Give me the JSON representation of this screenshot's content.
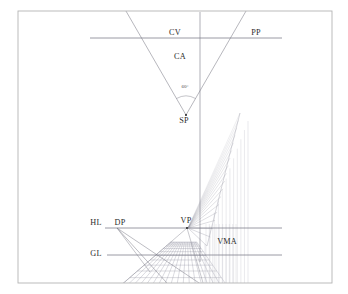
{
  "figure": {
    "background_color": "#ffffff",
    "border_color": "#b4b4b4",
    "line_color": "#7a7a86",
    "grid_color": "#9a9aa6",
    "grid_color_light": "#b9b9c4",
    "label_color": "#2b2b2b"
  },
  "border": {
    "x": 18,
    "y": 11,
    "width": 314,
    "height": 272
  },
  "labels": [
    {
      "id": "CV",
      "text": "CV",
      "x": 175,
      "y": 35,
      "anchor": "middle",
      "name": "label-cv"
    },
    {
      "id": "PP",
      "text": "PP",
      "x": 256,
      "y": 35,
      "anchor": "middle",
      "name": "label-pp"
    },
    {
      "id": "CA",
      "text": "CA",
      "x": 180,
      "y": 59,
      "anchor": "middle",
      "name": "label-ca"
    },
    {
      "id": "SP",
      "text": "SP",
      "x": 184,
      "y": 123,
      "anchor": "middle",
      "name": "label-sp"
    },
    {
      "id": "HL",
      "text": "HL",
      "x": 96,
      "y": 225,
      "anchor": "middle",
      "name": "label-hl"
    },
    {
      "id": "DP",
      "text": "DP",
      "x": 120,
      "y": 225,
      "anchor": "middle",
      "name": "label-dp"
    },
    {
      "id": "VP",
      "text": "VP",
      "x": 186,
      "y": 223,
      "anchor": "middle",
      "name": "label-vp"
    },
    {
      "id": "GL",
      "text": "GL",
      "x": 96,
      "y": 256,
      "anchor": "middle",
      "name": "label-gl"
    },
    {
      "id": "VMA",
      "text": "VMA",
      "x": 227,
      "y": 244,
      "anchor": "middle",
      "name": "label-vma"
    }
  ],
  "angle_annotation": {
    "text": "60°",
    "x": 185,
    "y": 88,
    "arc_radius": 19,
    "name": "cone-angle-label"
  },
  "geometry": {
    "station_point": {
      "x": 186,
      "y": 115
    },
    "cone_angle_deg": 60,
    "center_of_vision": {
      "x": 200,
      "y": 38
    },
    "vanishing_point": {
      "x": 187,
      "y": 228
    },
    "distance_point": {
      "x": 117,
      "y": 228
    },
    "vertical_axis_x": 200,
    "picture_plane_line": {
      "x1": 90,
      "x2": 282,
      "y": 38
    },
    "horizon_line": {
      "x1": 105,
      "x2": 282,
      "y": 228
    },
    "ground_line": {
      "x1": 107,
      "x2": 282,
      "y": 255
    },
    "vertical_axis": {
      "y1": 12,
      "y2": 262
    },
    "ground_grid": {
      "left_x": 112,
      "right_x": 232,
      "front_y": 293,
      "back_y": 242,
      "transversal_count": 13,
      "orthogonal_count": 17
    },
    "wall_grid": {
      "base_x": 205,
      "top_x": 240,
      "top_y": 113,
      "bottom_y": 246,
      "ray_count": 17,
      "vertical_count": 11,
      "right_edge_x": 248
    },
    "vma_band": {
      "x1": 206,
      "x2": 236,
      "y1": 228,
      "y2": 293,
      "line_count": 9
    }
  },
  "legend_meanings": {
    "CV": "Center of Vision",
    "PP": "Picture Plane",
    "CA": "Cone Angle",
    "SP": "Station Point",
    "HL": "Horizon Line",
    "DP": "Distance Point",
    "VP": "Vanishing Point",
    "GL": "Ground Line",
    "VMA": "Vertical Measuring Area"
  }
}
